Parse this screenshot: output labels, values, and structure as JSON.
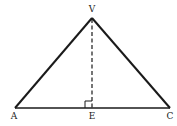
{
  "diagram": {
    "type": "triangle-with-altitude",
    "labels": {
      "apex": "V",
      "left": "A",
      "foot": "E",
      "right": "C"
    },
    "points": {
      "V": [
        92,
        18
      ],
      "A": [
        15,
        108
      ],
      "E": [
        92,
        108
      ],
      "C": [
        170,
        108
      ]
    },
    "right_angle_at": "E",
    "altitude_style": "dashed",
    "stroke_color": "#1a1a1a"
  }
}
